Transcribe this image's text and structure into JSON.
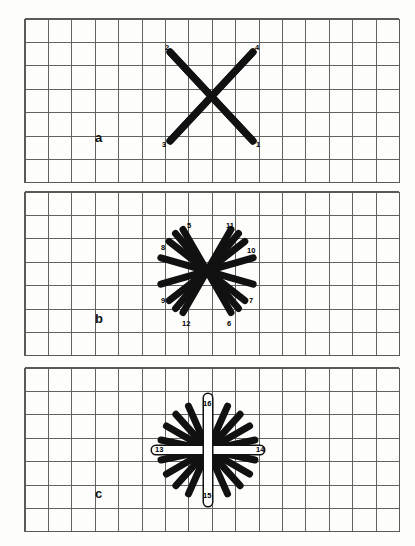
{
  "figure": {
    "background_color": "#fdfdfb",
    "grid_line_color": "#5a5a58",
    "stroke_color": "#111111",
    "highlight_fill": "#ffffff"
  },
  "panels": [
    {
      "id": "a",
      "letter": "a",
      "letter_x": 95,
      "letter_y": 131,
      "grid": {
        "x": 25,
        "y": 19,
        "cols": 16,
        "rows": 7,
        "cell": 23.4
      },
      "center": {
        "x": 211,
        "y": 96
      },
      "stroke_width": 7,
      "strokes": [
        {
          "n": "1",
          "x1": 170,
          "y1": 52,
          "x2": 253,
          "y2": 141,
          "label_x": 256,
          "label_y": 141
        },
        {
          "n": "2",
          "x1": 253,
          "y1": 52,
          "x2": 170,
          "y2": 141,
          "label_x": 165,
          "label_y": 44
        },
        {
          "n": "3",
          "x1": 170,
          "y1": 141,
          "x2": 253,
          "y2": 52,
          "label_x": 162,
          "label_y": 141
        },
        {
          "n": "4",
          "x1": 253,
          "y1": 141,
          "x2": 170,
          "y2": 52,
          "label_x": 255,
          "label_y": 44
        }
      ],
      "label_numbers": [
        "1",
        "2",
        "3",
        "4"
      ]
    },
    {
      "id": "b",
      "letter": "b",
      "letter_x": 95,
      "letter_y": 312,
      "grid": {
        "x": 25,
        "y": 192,
        "cols": 16,
        "rows": 7,
        "cell": 23.4
      },
      "center": {
        "x": 207,
        "y": 271
      },
      "stroke_width": 7,
      "radius": 48,
      "label_numbers": [
        "5",
        "6",
        "7",
        "8",
        "9",
        "10",
        "11",
        "12"
      ],
      "labels": [
        {
          "n": "5",
          "x": 187,
          "y": 222
        },
        {
          "n": "11",
          "x": 226,
          "y": 222
        },
        {
          "n": "8",
          "x": 161,
          "y": 244
        },
        {
          "n": "10",
          "x": 247,
          "y": 247
        },
        {
          "n": "9",
          "x": 161,
          "y": 297
        },
        {
          "n": "7",
          "x": 249,
          "y": 297
        },
        {
          "n": "12",
          "x": 182,
          "y": 320
        },
        {
          "n": "6",
          "x": 227,
          "y": 320
        }
      ]
    },
    {
      "id": "c",
      "letter": "c",
      "letter_x": 95,
      "letter_y": 487,
      "grid": {
        "x": 25,
        "y": 368,
        "cols": 16,
        "rows": 7,
        "cell": 23.4
      },
      "center": {
        "x": 208,
        "y": 450
      },
      "stroke_width": 7,
      "radius": 48,
      "label_numbers": [
        "13",
        "14",
        "15",
        "16"
      ],
      "labels": [
        {
          "n": "16",
          "x": 203,
          "y": 400
        },
        {
          "n": "13",
          "x": 155,
          "y": 446
        },
        {
          "n": "14",
          "x": 256,
          "y": 446
        },
        {
          "n": "15",
          "x": 203,
          "y": 492
        }
      ]
    }
  ],
  "chart_data": {
    "type": "diagram",
    "panels": [
      {
        "label": "a",
        "description": "Two crossing diagonal strokes forming an X, numbered 1-4",
        "stroke_count": 4,
        "numbers": [
          1,
          2,
          3,
          4
        ],
        "grid_cols": 16,
        "grid_rows": 7
      },
      {
        "label": "b",
        "description": "Radial asterisk of eight additional diagonal strokes, numbered 5-12",
        "stroke_count": 12,
        "numbers": [
          5,
          6,
          7,
          8,
          9,
          10,
          11,
          12
        ],
        "grid_cols": 16,
        "grid_rows": 7
      },
      {
        "label": "c",
        "description": "Full sixteen-spoke rosette with white vertical and horizontal strokes 13-16 drawn over the black spokes",
        "stroke_count": 16,
        "numbers": [
          13,
          14,
          15,
          16
        ],
        "grid_cols": 16,
        "grid_rows": 7
      }
    ]
  }
}
